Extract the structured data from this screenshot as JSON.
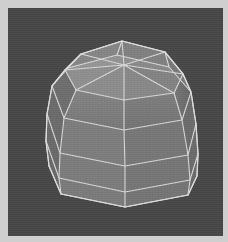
{
  "app": {
    "title": "3D Viewport",
    "window_background": "#cfcfcf",
    "viewport_background": "#464646"
  },
  "viewport": {
    "name": "perspective-viewport",
    "width": 215,
    "height": 228,
    "origin_x": 8,
    "origin_y": 8
  },
  "model": {
    "name": "octagonal-dome-mesh",
    "description": "Shaded wireframe polygonal dome / drum primitive",
    "shading": "flat-shaded with wireframe overlay",
    "wireframe_color": "#d8d8d8",
    "wireframe_width": 1.1,
    "segments": 8,
    "rings": 4,
    "colors": {
      "top_cap": "#8d8d8d",
      "top_cap_shadow": "#848484",
      "front_light": "#7e7e7e",
      "front_mid": "#797979",
      "front_dark": "#6f6f6f",
      "side_right": "#6b6b6b",
      "side_right_dark": "#656565",
      "back_face": "#2b2b2b",
      "back_face_dark": "#242424",
      "silhouette": "#dcdcdc"
    },
    "cap": {
      "center_hub": [
        116,
        57
      ],
      "ring_points": [
        [
          73,
          46
        ],
        [
          114,
          33
        ],
        [
          157,
          44
        ],
        [
          175,
          66
        ],
        [
          166,
          85
        ],
        [
          116,
          92
        ],
        [
          68,
          82
        ],
        [
          57,
          62
        ]
      ]
    },
    "body_rings": [
      {
        "index": 0,
        "label": "ring-shoulder",
        "points": [
          [
            57,
            62
          ],
          [
            73,
            46
          ],
          [
            114,
            33
          ],
          [
            157,
            44
          ],
          [
            175,
            66
          ],
          [
            166,
            85
          ],
          [
            116,
            92
          ],
          [
            68,
            82
          ]
        ]
      },
      {
        "index": 1,
        "label": "ring-upper",
        "points": [
          [
            44,
            78
          ],
          [
            60,
            60
          ],
          [
            109,
            47
          ],
          [
            161,
            59
          ],
          [
            183,
            84
          ],
          [
            174,
            112
          ],
          [
            116,
            122
          ],
          [
            56,
            110
          ]
        ]
      },
      {
        "index": 2,
        "label": "ring-middle",
        "points": [
          [
            39,
            106
          ],
          [
            56,
            89
          ],
          [
            107,
            78
          ],
          [
            164,
            90
          ],
          [
            188,
            116
          ],
          [
            180,
            147
          ],
          [
            117,
            158
          ],
          [
            52,
            145
          ]
        ]
      },
      {
        "index": 3,
        "label": "ring-lower",
        "points": [
          [
            38,
            133
          ],
          [
            55,
            118
          ],
          [
            106,
            108
          ],
          [
            166,
            120
          ],
          [
            190,
            146
          ],
          [
            182,
            172
          ],
          [
            117,
            184
          ],
          [
            51,
            170
          ]
        ]
      },
      {
        "index": 4,
        "label": "ring-base",
        "points": [
          [
            41,
            158
          ],
          [
            57,
            144
          ],
          [
            106,
            135
          ],
          [
            168,
            147
          ],
          [
            189,
            168
          ],
          [
            180,
            187
          ],
          [
            117,
            199
          ],
          [
            53,
            186
          ]
        ]
      }
    ],
    "spokes_count": 8,
    "vertical_edges_count": 8
  }
}
